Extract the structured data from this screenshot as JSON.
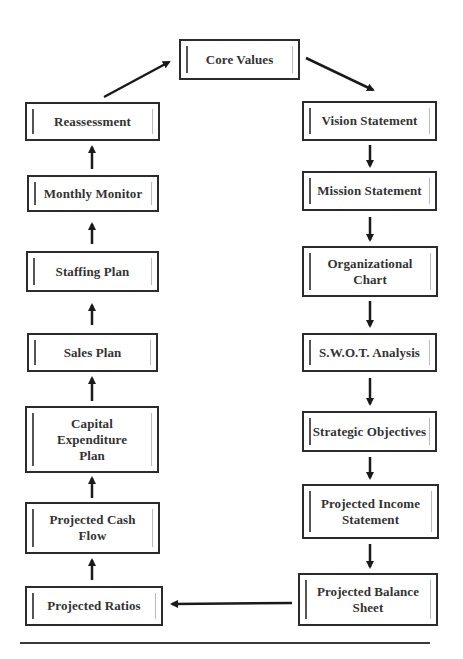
{
  "diagram": {
    "type": "cyclic-flowchart",
    "top": {
      "id": "core-values",
      "label": "Core Values"
    },
    "right_column": [
      {
        "id": "vision-statement",
        "label": "Vision Statement"
      },
      {
        "id": "mission-statement",
        "label": "Mission Statement"
      },
      {
        "id": "organizational-chart",
        "label": "Organizational Chart"
      },
      {
        "id": "swot-analysis",
        "label": "S.W.O.T. Analysis"
      },
      {
        "id": "strategic-objectives",
        "label": "Strategic Objectives"
      },
      {
        "id": "projected-income-statement",
        "label": "Projected Income Statement"
      },
      {
        "id": "projected-balance-sheet",
        "label": "Projected Balance Sheet"
      }
    ],
    "left_column": [
      {
        "id": "projected-ratios",
        "label": "Projected Ratios"
      },
      {
        "id": "projected-cash-flow",
        "label": "Projected Cash Flow"
      },
      {
        "id": "capital-expenditure-plan",
        "label": "Capital Expenditure Plan"
      },
      {
        "id": "sales-plan",
        "label": "Sales Plan"
      },
      {
        "id": "staffing-plan",
        "label": "Staffing Plan"
      },
      {
        "id": "monthly-monitor",
        "label": "Monthly Monitor"
      },
      {
        "id": "reassessment",
        "label": "Reassessment"
      }
    ],
    "flow": [
      "Core Values",
      "Vision Statement",
      "Mission Statement",
      "Organizational Chart",
      "S.W.O.T. Analysis",
      "Strategic Objectives",
      "Projected Income Statement",
      "Projected Balance Sheet",
      "Projected Ratios",
      "Projected Cash Flow",
      "Capital Expenditure Plan",
      "Sales Plan",
      "Staffing Plan",
      "Monthly Monitor",
      "Reassessment",
      "Core Values"
    ],
    "colors": {
      "border": "#2b2b2b",
      "arrow": "#1a1a1a",
      "text": "#333333",
      "background": "#ffffff"
    }
  }
}
